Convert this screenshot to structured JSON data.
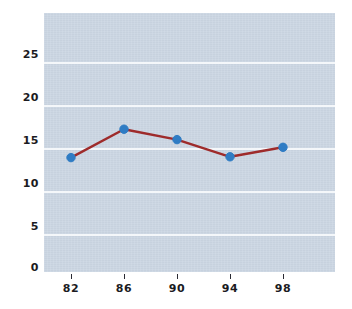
{
  "chart_data": {
    "type": "line",
    "title": "",
    "subtitle": "",
    "xlabel": "",
    "ylabel": "",
    "x": [
      82,
      86,
      90,
      94,
      98
    ],
    "categories": [
      "82",
      "86",
      "90",
      "94",
      "98"
    ],
    "values": [
      13.3,
      16.6,
      15.4,
      13.4,
      14.5
    ],
    "series": [
      {
        "name": "series-1",
        "values": [
          13.3,
          16.6,
          15.4,
          13.4,
          14.5
        ]
      }
    ],
    "xlim": [
      80,
      100
    ],
    "ylim": [
      0,
      27
    ],
    "ytick_values": [
      0,
      5,
      10,
      15,
      20,
      25
    ],
    "ytick_labels": [
      "0",
      "5",
      "10",
      "15",
      "20",
      "25"
    ],
    "xtick_labels": [
      "82",
      "86",
      "90",
      "94",
      "98"
    ],
    "grid": "horizontal",
    "legend": "none",
    "annotations": [],
    "colors": {
      "plot_background": "#ccd7e4",
      "page_background": "#ffffff",
      "gridline": "#f4f7fa",
      "line": "#9e2b2b",
      "marker_fill": "#2f7cc4",
      "marker_edge": "#2f7cc4",
      "tick_text": "#1b1b22"
    }
  }
}
